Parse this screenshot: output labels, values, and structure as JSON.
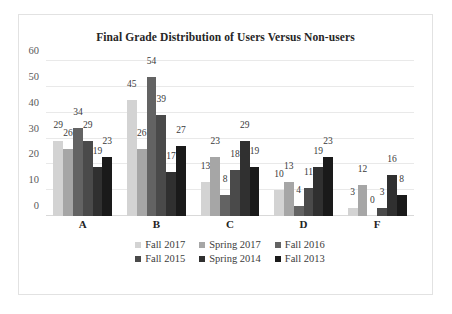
{
  "chart_data": {
    "type": "bar",
    "title": "Final Grade Distribution of Users Versus Non-users",
    "xlabel": "",
    "ylabel": "",
    "categories": [
      "A",
      "B",
      "C",
      "D",
      "F"
    ],
    "ylim": [
      0,
      60
    ],
    "yticks": [
      0,
      10,
      20,
      30,
      40,
      50,
      60
    ],
    "grid": true,
    "legend_position": "bottom",
    "series": [
      {
        "name": "Fall 2017",
        "color": "#d3d3d3",
        "values": [
          29,
          45,
          13,
          10,
          3
        ]
      },
      {
        "name": "Spring 2017",
        "color": "#a6a6a6",
        "values": [
          26,
          26,
          23,
          13,
          12
        ]
      },
      {
        "name": "Fall 2016",
        "color": "#636363",
        "values": [
          34,
          54,
          8,
          4,
          0
        ]
      },
      {
        "name": "Fall 2015",
        "color": "#4a4a4a",
        "values": [
          29,
          39,
          18,
          11,
          3
        ]
      },
      {
        "name": "Spring 2014",
        "color": "#303030",
        "values": [
          19,
          17,
          29,
          19,
          16
        ]
      },
      {
        "name": "Fall 2013",
        "color": "#1a1a1a",
        "values": [
          23,
          27,
          19,
          23,
          8
        ]
      }
    ]
  }
}
